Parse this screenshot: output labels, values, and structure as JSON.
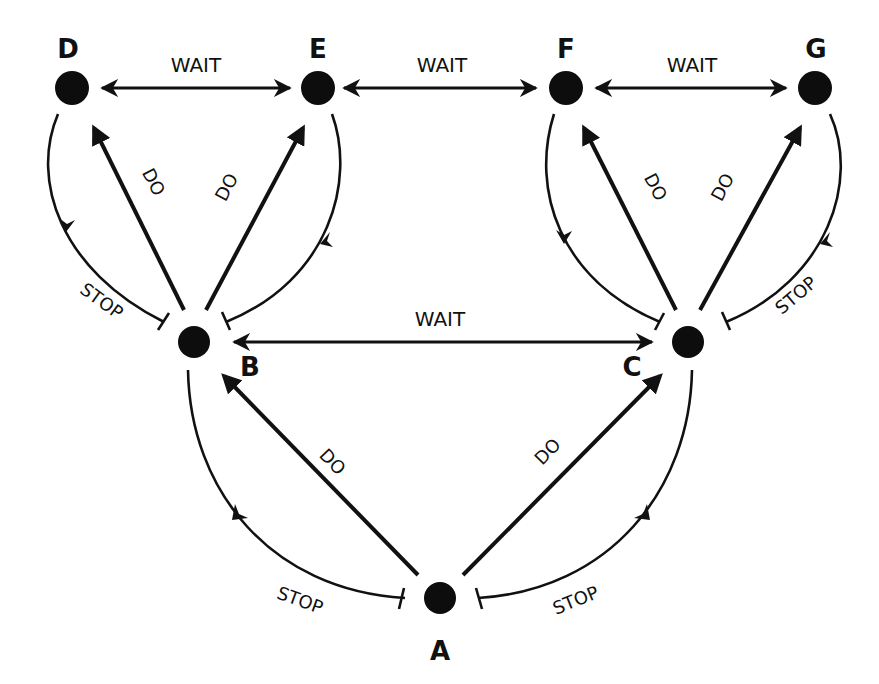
{
  "diagram": {
    "type": "state-transition",
    "colors": {
      "ink": "#111111",
      "background": "#ffffff"
    },
    "nodes": [
      {
        "id": "A",
        "label": "A"
      },
      {
        "id": "B",
        "label": "B"
      },
      {
        "id": "C",
        "label": "C"
      },
      {
        "id": "D",
        "label": "D"
      },
      {
        "id": "E",
        "label": "E"
      },
      {
        "id": "F",
        "label": "F"
      },
      {
        "id": "G",
        "label": "G"
      }
    ],
    "edge_labels": {
      "do": "DO",
      "stop": "STOP",
      "wait": "WAIT"
    },
    "edges": [
      {
        "from": "A",
        "to": "B",
        "type": "DO",
        "label": "DO"
      },
      {
        "from": "A",
        "to": "C",
        "type": "DO",
        "label": "DO"
      },
      {
        "from": "B",
        "to": "A",
        "type": "STOP",
        "label": "STOP"
      },
      {
        "from": "C",
        "to": "A",
        "type": "STOP",
        "label": "STOP"
      },
      {
        "from": "B",
        "to": "C",
        "type": "WAIT",
        "label": "WAIT",
        "bidirectional": true
      },
      {
        "from": "B",
        "to": "D",
        "type": "DO",
        "label": "DO"
      },
      {
        "from": "B",
        "to": "E",
        "type": "DO",
        "label": "DO"
      },
      {
        "from": "D",
        "to": "B",
        "type": "STOP",
        "label": "STOP"
      },
      {
        "from": "E",
        "to": "B",
        "type": "STOP",
        "label": ""
      },
      {
        "from": "C",
        "to": "F",
        "type": "DO",
        "label": "DO"
      },
      {
        "from": "C",
        "to": "G",
        "type": "DO",
        "label": "DO"
      },
      {
        "from": "F",
        "to": "C",
        "type": "STOP",
        "label": ""
      },
      {
        "from": "G",
        "to": "C",
        "type": "STOP",
        "label": "STOP"
      },
      {
        "from": "D",
        "to": "E",
        "type": "WAIT",
        "label": "WAIT",
        "bidirectional": true
      },
      {
        "from": "E",
        "to": "F",
        "type": "WAIT",
        "label": "WAIT",
        "bidirectional": true
      },
      {
        "from": "F",
        "to": "G",
        "type": "WAIT",
        "label": "WAIT",
        "bidirectional": true
      }
    ]
  }
}
